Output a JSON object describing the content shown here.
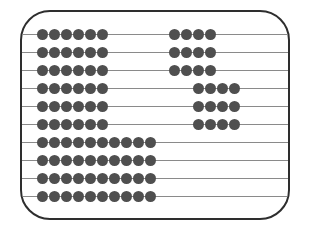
{
  "diagram": {
    "type": "abacus",
    "frame": {
      "border_color": "#2e2e2e",
      "rod_color": "#8a8a8a",
      "bead_color": "#4f4f4f"
    },
    "rows": [
      {
        "groups": [
          {
            "start": 0,
            "count": 6
          },
          {
            "start": 11,
            "count": 4
          }
        ]
      },
      {
        "groups": [
          {
            "start": 0,
            "count": 6
          },
          {
            "start": 11,
            "count": 4
          }
        ]
      },
      {
        "groups": [
          {
            "start": 0,
            "count": 6
          },
          {
            "start": 11,
            "count": 4
          }
        ]
      },
      {
        "groups": [
          {
            "start": 0,
            "count": 6
          },
          {
            "start": 13,
            "count": 4
          }
        ]
      },
      {
        "groups": [
          {
            "start": 0,
            "count": 6
          },
          {
            "start": 13,
            "count": 4
          }
        ]
      },
      {
        "groups": [
          {
            "start": 0,
            "count": 6
          },
          {
            "start": 13,
            "count": 4
          }
        ]
      },
      {
        "groups": [
          {
            "start": 0,
            "count": 10
          }
        ]
      },
      {
        "groups": [
          {
            "start": 0,
            "count": 10
          }
        ]
      },
      {
        "groups": [
          {
            "start": 0,
            "count": 10
          }
        ]
      },
      {
        "groups": [
          {
            "start": 0,
            "count": 10
          }
        ]
      }
    ],
    "row_bead_totals": [
      10,
      10,
      10,
      10,
      10,
      10,
      10,
      10,
      10,
      10
    ]
  }
}
